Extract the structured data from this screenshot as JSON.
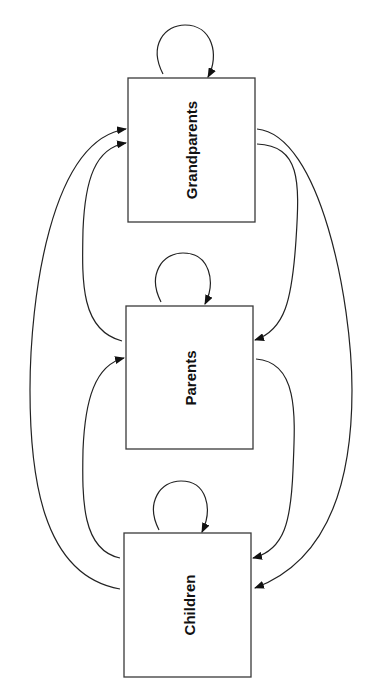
{
  "diagram": {
    "nodes": [
      {
        "id": "grandparents",
        "label": "Grandparents"
      },
      {
        "id": "parents",
        "label": "Parents"
      },
      {
        "id": "children",
        "label": "Children"
      }
    ],
    "edges": [
      {
        "from": "grandparents",
        "to": "grandparents",
        "type": "self-loop"
      },
      {
        "from": "parents",
        "to": "parents",
        "type": "self-loop"
      },
      {
        "from": "children",
        "to": "children",
        "type": "self-loop"
      },
      {
        "from": "grandparents",
        "to": "parents"
      },
      {
        "from": "grandparents",
        "to": "children"
      },
      {
        "from": "parents",
        "to": "children"
      },
      {
        "from": "parents",
        "to": "grandparents"
      },
      {
        "from": "children",
        "to": "grandparents"
      },
      {
        "from": "children",
        "to": "parents"
      }
    ]
  }
}
